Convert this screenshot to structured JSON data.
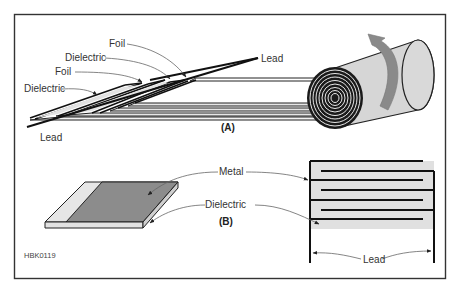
{
  "figure": {
    "id_label": "HBK0119",
    "panel_a": {
      "caption": "(A)",
      "labels": {
        "foil_top": "Foil",
        "dielectric_upper": "Dielectric",
        "foil_lower": "Foil",
        "dielectric_lower": "Dielectric",
        "lead_top": "Lead",
        "lead_bottom": "Lead"
      },
      "description": "Rolled capacitor: alternating foil and dielectric strips wound into a cylinder with rotation arrow"
    },
    "panel_b": {
      "caption": "(B)",
      "labels": {
        "metal": "Metal",
        "dielectric": "Dielectric",
        "lead": "Lead"
      },
      "description": "Stacked plate capacitor: metal-on-dielectric sheet and interleaved plates with two leads"
    },
    "colors": {
      "frame": "#333333",
      "line": "#111111",
      "dielectric_fill": "#e0e0e0",
      "metal_fill": "#8c8c8c",
      "roll_fill": "#d6d6d6",
      "arrow_fill": "#8a8a8a",
      "leader": "#666666"
    }
  }
}
